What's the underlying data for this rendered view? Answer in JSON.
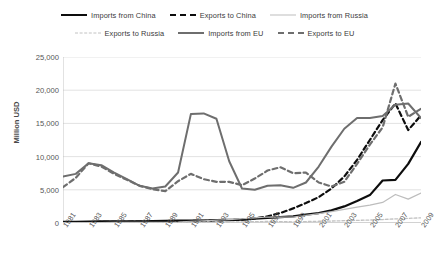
{
  "chart_data": {
    "type": "line",
    "title": "",
    "xlabel": "",
    "ylabel": "Million USD",
    "ylim": [
      0,
      25000
    ],
    "yticks": [
      0,
      5000,
      10000,
      15000,
      20000,
      25000
    ],
    "ytick_labels": [
      "0",
      "5,000",
      "10,000",
      "15,000",
      "20,000",
      "25,000"
    ],
    "grid": true,
    "legend_position": "top",
    "x": [
      1981,
      1982,
      1983,
      1984,
      1985,
      1986,
      1987,
      1988,
      1989,
      1990,
      1991,
      1992,
      1993,
      1994,
      1995,
      1996,
      1997,
      1998,
      1999,
      2000,
      2001,
      2002,
      2003,
      2004,
      2005,
      2006,
      2007,
      2008,
      2009
    ],
    "xtick_labels": [
      "1981",
      "1983",
      "1985",
      "1987",
      "1989",
      "1991",
      "1993",
      "1995",
      "1997",
      "1999",
      "2001",
      "2003",
      "2005",
      "2007",
      "2009"
    ],
    "series": [
      {
        "name": "Imports from China",
        "color": "#0d0d0d",
        "style": "solid",
        "width": 2.2,
        "values": [
          180,
          190,
          200,
          230,
          260,
          250,
          260,
          300,
          330,
          350,
          360,
          380,
          420,
          470,
          520,
          640,
          760,
          880,
          1000,
          1250,
          1500,
          1900,
          2500,
          3300,
          4200,
          6400,
          6500,
          8900,
          12200
        ]
      },
      {
        "name": "Exports to China",
        "color": "#0d0d0d",
        "style": "dashed",
        "width": 2.2,
        "values": [
          120,
          130,
          140,
          160,
          180,
          190,
          200,
          230,
          260,
          280,
          300,
          330,
          380,
          430,
          500,
          700,
          1000,
          1500,
          2200,
          3000,
          3900,
          5200,
          7000,
          9500,
          12500,
          15500,
          18000,
          14000,
          16200
        ]
      },
      {
        "name": "Imports from Russia",
        "color": "#bdbdbd",
        "style": "solid",
        "width": 1.2,
        "values": [
          60,
          60,
          70,
          70,
          80,
          80,
          90,
          100,
          110,
          150,
          260,
          330,
          420,
          520,
          640,
          760,
          900,
          880,
          900,
          1150,
          1400,
          1700,
          2050,
          2400,
          2700,
          3100,
          4300,
          3600,
          4500
        ]
      },
      {
        "name": "Exports to Russia",
        "color": "#c2c2c2",
        "style": "dashed",
        "width": 1.3,
        "values": [
          30,
          30,
          30,
          40,
          40,
          40,
          50,
          50,
          60,
          70,
          90,
          110,
          130,
          150,
          180,
          200,
          230,
          200,
          180,
          220,
          260,
          300,
          350,
          400,
          450,
          520,
          620,
          700,
          780
        ]
      },
      {
        "name": "Imports from EU",
        "color": "#6e6e6e",
        "style": "solid",
        "width": 2.0,
        "values": [
          7000,
          7400,
          9000,
          8700,
          7600,
          6600,
          5600,
          5200,
          5500,
          7600,
          16400,
          16500,
          15700,
          9300,
          5200,
          5000,
          5600,
          5700,
          5300,
          6100,
          8500,
          11500,
          14200,
          15800,
          15800,
          16100,
          17800,
          18000,
          15800
        ]
      },
      {
        "name": "Exports to EU",
        "color": "#6e6e6e",
        "style": "dashed",
        "width": 2.2,
        "values": [
          5400,
          6800,
          9000,
          8500,
          7400,
          6500,
          5600,
          5100,
          4800,
          6300,
          7400,
          6600,
          6200,
          6200,
          5700,
          6700,
          7900,
          8400,
          7500,
          7600,
          6100,
          5500,
          6200,
          8900,
          11800,
          14400,
          21000,
          16000,
          17200
        ]
      }
    ]
  }
}
